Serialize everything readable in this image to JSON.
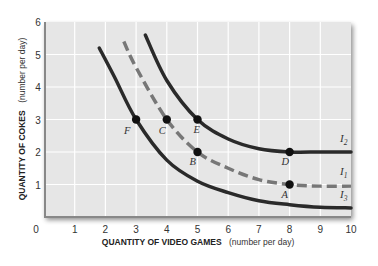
{
  "chart_data": {
    "type": "line",
    "title": "",
    "xlabel": "QUANTITY OF VIDEO GAMES",
    "xlabel_unit": "(number per day)",
    "ylabel": "QUANTITY OF COKES",
    "ylabel_unit": "(number per day)",
    "xlim": [
      0,
      10
    ],
    "ylim": [
      0,
      6
    ],
    "x_ticks": [
      "0",
      "1",
      "2",
      "3",
      "4",
      "5",
      "6",
      "7",
      "8",
      "9",
      "10"
    ],
    "y_ticks": [
      "1",
      "2",
      "3",
      "4",
      "5",
      "6"
    ],
    "grid": true,
    "series": [
      {
        "name": "I2",
        "label_main": "I",
        "label_sub": "2",
        "style": "solid",
        "color": "#2a2a2a",
        "x": [
          3.3,
          4.0,
          5.0,
          6.0,
          7.0,
          8.0,
          9.0,
          10.0
        ],
        "y": [
          5.6,
          4.2,
          3.0,
          2.4,
          2.1,
          2.0,
          2.0,
          2.0
        ]
      },
      {
        "name": "I1",
        "label_main": "I",
        "label_sub": "1",
        "style": "dashed",
        "color": "#777777",
        "x": [
          2.6,
          3.0,
          4.0,
          5.0,
          6.0,
          7.0,
          8.0,
          9.0,
          10.0
        ],
        "y": [
          5.4,
          4.6,
          3.0,
          2.0,
          1.5,
          1.15,
          1.0,
          0.95,
          0.95
        ]
      },
      {
        "name": "I3",
        "label_main": "I",
        "label_sub": "3",
        "style": "solid",
        "color": "#2a2a2a",
        "x": [
          1.8,
          2.3,
          3.0,
          4.0,
          5.0,
          6.0,
          7.0,
          8.0,
          9.0,
          10.0
        ],
        "y": [
          5.2,
          4.3,
          3.0,
          1.75,
          1.1,
          0.75,
          0.5,
          0.38,
          0.3,
          0.28
        ]
      }
    ],
    "points": [
      {
        "label": "F",
        "x": 3,
        "y": 3
      },
      {
        "label": "C",
        "x": 4,
        "y": 3
      },
      {
        "label": "E",
        "x": 5,
        "y": 3
      },
      {
        "label": "B",
        "x": 5,
        "y": 2
      },
      {
        "label": "D",
        "x": 8,
        "y": 2
      },
      {
        "label": "A",
        "x": 8,
        "y": 1
      }
    ]
  }
}
